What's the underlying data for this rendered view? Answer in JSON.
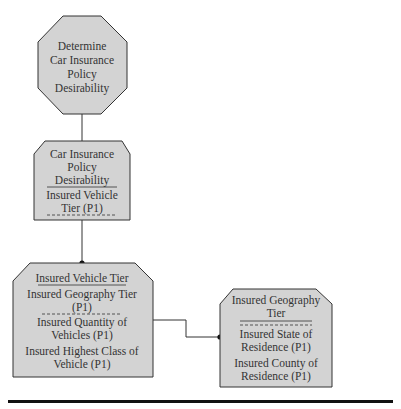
{
  "diagram": {
    "fill_color": "#d3d3d3",
    "stroke_color": "#333333",
    "nodes": {
      "process": {
        "shape": "octagon",
        "lines": [
          "Determine",
          "Car Insurance",
          "Policy",
          "Desirability"
        ]
      },
      "desirability_entity": {
        "shape": "clipped-rectangle",
        "key_lines": [
          "Car Insurance",
          "Policy",
          "Desirability"
        ],
        "attribute_lines": [
          "Insured Vehicle",
          "Tier (P1)"
        ]
      },
      "vehicle_tier_entity": {
        "shape": "clipped-rectangle",
        "key_lines": [
          "Insured Vehicle Tier"
        ],
        "primary_attribute_lines": [
          "Insured Geography Tier",
          "(P1)"
        ],
        "attribute_groups": [
          [
            "Insured Quantity of",
            "Vehicles (P1)"
          ],
          [
            "Insured Highest Class of",
            "Vehicle (P1)"
          ]
        ]
      },
      "geography_tier_entity": {
        "shape": "clipped-rectangle",
        "key_lines": [
          "Insured Geography",
          "Tier"
        ],
        "attribute_groups": [
          [
            "Insured State of",
            "Residence (P1)"
          ],
          [
            "Insured County of",
            "Residence (P1)"
          ]
        ]
      }
    },
    "edges": [
      {
        "from": "process",
        "to": "desirability_entity",
        "end": "arrow"
      },
      {
        "from": "desirability_entity",
        "to": "vehicle_tier_entity",
        "end": "dot"
      },
      {
        "from": "vehicle_tier_entity",
        "to": "geography_tier_entity",
        "end": "dot"
      }
    ]
  }
}
